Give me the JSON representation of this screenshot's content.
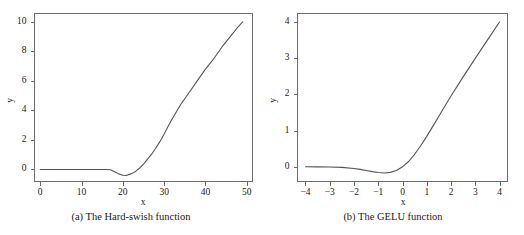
{
  "figure": {
    "background": "#ffffff",
    "line_color": "#555555",
    "axis_color": "#6e6e6e",
    "panels": [
      "a",
      "b"
    ]
  },
  "panel_a": {
    "caption": "(a) The Hard-swish function",
    "xlabel": "x",
    "ylabel": "y",
    "xticklabels": [
      "0",
      "10",
      "20",
      "30",
      "40",
      "50"
    ],
    "yticklabels": [
      "0",
      "2",
      "4",
      "6",
      "8",
      "10"
    ]
  },
  "panel_b": {
    "caption": "(b) The GELU function",
    "xlabel": "x",
    "ylabel": "y",
    "xticklabels": [
      "−4",
      "−3",
      "−2",
      "−1",
      "0",
      "1",
      "2",
      "3",
      "4"
    ],
    "yticklabels": [
      "0",
      "1",
      "2",
      "3",
      "4"
    ]
  },
  "chart_data": [
    {
      "type": "line",
      "title": "(a) The Hard-swish function",
      "xlabel": "x",
      "ylabel": "y",
      "grid": false,
      "legend": false,
      "xlim": [
        -1.5,
        51.5
      ],
      "ylim": [
        -0.85,
        10.6
      ],
      "xticks": [
        0,
        10,
        20,
        30,
        40,
        50
      ],
      "yticks": [
        0,
        2,
        4,
        6,
        8,
        10
      ],
      "series": [
        {
          "name": "Hard-swish",
          "color": "#555555",
          "x": [
            0,
            2,
            4,
            6,
            8,
            10,
            12,
            14,
            16,
            17,
            18,
            19,
            20,
            20.8,
            22,
            23,
            24,
            25,
            26,
            27,
            28,
            29,
            30,
            31,
            32,
            34,
            36,
            38,
            40,
            42,
            44,
            46,
            48,
            49
          ],
          "y": [
            0,
            0,
            0,
            0,
            0,
            0,
            0,
            0,
            0,
            -0.02,
            -0.15,
            -0.3,
            -0.39,
            -0.41,
            -0.3,
            -0.15,
            0.08,
            0.36,
            0.7,
            1.05,
            1.45,
            1.9,
            2.4,
            2.95,
            3.45,
            4.4,
            5.2,
            6.0,
            6.8,
            7.5,
            8.3,
            9.0,
            9.7,
            10.0
          ]
        }
      ]
    },
    {
      "type": "line",
      "title": "(b) The GELU function",
      "xlabel": "x",
      "ylabel": "y",
      "grid": false,
      "legend": false,
      "xlim": [
        -4.35,
        4.35
      ],
      "ylim": [
        -0.42,
        4.25
      ],
      "xticks": [
        -4,
        -3,
        -2,
        -1,
        0,
        1,
        2,
        3,
        4
      ],
      "yticks": [
        0,
        1,
        2,
        3,
        4
      ],
      "series": [
        {
          "name": "GELU",
          "color": "#555555",
          "x": [
            -4,
            -3.5,
            -3,
            -2.5,
            -2,
            -1.75,
            -1.5,
            -1.25,
            -1,
            -0.75,
            -0.5,
            -0.25,
            0,
            0.25,
            0.5,
            0.75,
            1,
            1.25,
            1.5,
            1.75,
            2,
            2.5,
            3,
            3.5,
            4
          ],
          "y": [
            -0.0001,
            -0.0008,
            -0.004,
            -0.015,
            -0.0455,
            -0.0708,
            -0.1005,
            -0.1333,
            -0.1587,
            -0.1698,
            -0.1543,
            -0.1029,
            0,
            0.1471,
            0.3457,
            0.5802,
            0.8413,
            1.1167,
            1.3995,
            1.6792,
            1.9545,
            2.4846,
            2.996,
            3.4992,
            4.0
          ]
        }
      ]
    }
  ]
}
